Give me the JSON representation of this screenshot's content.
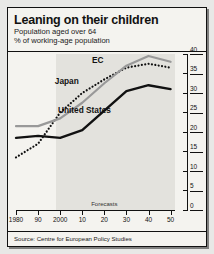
{
  "header": {
    "title": "Leaning on their children",
    "subtitle_1": "Population aged over 64",
    "subtitle_2": "% of working-age population"
  },
  "source": {
    "text": "Source: Centre for European Policy Studies"
  },
  "annotations": {
    "forecasts_label": "Forecasts"
  },
  "chart_data": {
    "type": "line",
    "title": "Leaning on their children",
    "subtitle": "Population aged over 64 — % of working-age population",
    "xlabel": "",
    "ylabel": "% of working-age population",
    "xlim": [
      1980,
      2052
    ],
    "ylim": [
      0,
      40
    ],
    "yticks": [
      0,
      5,
      10,
      15,
      20,
      25,
      30,
      35,
      40
    ],
    "ytick_labels": [
      "0",
      "5",
      "10",
      "15",
      "20",
      "25",
      "30",
      "35",
      "40"
    ],
    "y_axis_position": "right",
    "xticks": [
      1980,
      1990,
      2000,
      2010,
      2020,
      2030,
      2040,
      2050
    ],
    "xtick_labels": [
      "1980",
      "90",
      "2000",
      "10",
      "20",
      "30",
      "40",
      "50"
    ],
    "grid": false,
    "legend": "inline-labels",
    "forecast_start": 1998,
    "forecast_shading": true,
    "x": [
      1980,
      1990,
      2000,
      2010,
      2020,
      2030,
      2040,
      2050
    ],
    "series": [
      {
        "name": "Japan",
        "style": "dotted",
        "color": "#111111",
        "label_x": 2003,
        "label_y": 33.0,
        "values": [
          13.5,
          17.0,
          25.0,
          30.0,
          33.5,
          36.5,
          37.5,
          36.5
        ]
      },
      {
        "name": "EC",
        "style": "solid-grey",
        "color": "#999999",
        "label_x": 2017,
        "label_y": 38.5,
        "values": [
          21.5,
          21.5,
          23.5,
          27.5,
          32.5,
          37.0,
          39.5,
          38.0
        ]
      },
      {
        "name": "United States",
        "style": "solid-black",
        "color": "#111111",
        "label_x": 2011,
        "label_y": 25.5,
        "values": [
          18.5,
          19.0,
          18.5,
          20.5,
          25.5,
          30.5,
          32.0,
          31.0
        ]
      }
    ]
  }
}
